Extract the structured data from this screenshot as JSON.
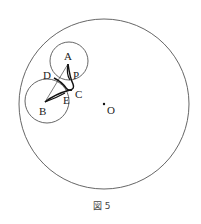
{
  "figure": {
    "caption": "図 5",
    "outer_circle": {
      "cx": 104,
      "cy": 104,
      "r": 85
    },
    "circle_a": {
      "cx": 69,
      "cy": 61,
      "r": 19
    },
    "circle_b": {
      "cx": 47,
      "cy": 101,
      "r": 22
    },
    "points": {
      "A": {
        "label": "A",
        "x": 68,
        "y": 64
      },
      "B": {
        "label": "B",
        "x": 45,
        "y": 102
      },
      "C": {
        "label": "C",
        "x": 72,
        "y": 88
      },
      "D": {
        "label": "D",
        "x": 54,
        "y": 78
      },
      "E": {
        "label": "E",
        "x": 65,
        "y": 93
      },
      "P": {
        "label": "P",
        "x": 73,
        "y": 73
      },
      "O": {
        "label": "O",
        "x": 104,
        "y": 104
      }
    }
  }
}
